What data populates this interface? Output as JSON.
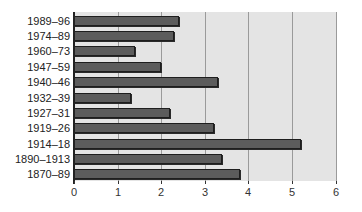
{
  "chart_data": {
    "type": "bar",
    "orientation": "horizontal",
    "title": "",
    "xlabel": "",
    "ylabel": "",
    "xlim": [
      0,
      6
    ],
    "xticks": [
      "0",
      "1",
      "2",
      "3",
      "4",
      "5",
      "6"
    ],
    "grid": "vertical",
    "legend": "none",
    "categories": [
      "1989–96",
      "1974–89",
      "1960–73",
      "1947–59",
      "1940–46",
      "1932–39",
      "1927–31",
      "1919–26",
      "1914–18",
      "1890–1913",
      "1870–89"
    ],
    "values": [
      2.4,
      2.3,
      1.4,
      2.0,
      3.3,
      1.3,
      2.2,
      3.2,
      5.2,
      3.4,
      3.8
    ]
  },
  "colors": {
    "plot_background": "#e4e4e4",
    "bar_fill": "#5c5c5c",
    "bar_border": "#1e1e1e",
    "gridline": "#9a9a9a"
  }
}
